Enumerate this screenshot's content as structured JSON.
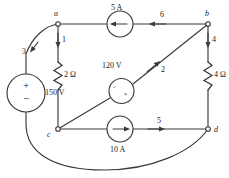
{
  "figure": {
    "line_color": "#3a3a3a",
    "text_color": "#1a1a1a"
  },
  "nodes": [
    {
      "id": "a",
      "label": "a"
    },
    {
      "id": "b",
      "label": "b"
    },
    {
      "id": "c",
      "label": "c"
    },
    {
      "id": "d",
      "label": "d"
    }
  ],
  "branches": [
    {
      "id": "1",
      "label": "1",
      "between": "a-c",
      "arrow": "down"
    },
    {
      "id": "2",
      "label": "2",
      "between": "c-b",
      "arrow": "up-right"
    },
    {
      "id": "3",
      "label": "3",
      "between": "a-source-d",
      "arrow": "down-left"
    },
    {
      "id": "4",
      "label": "4",
      "between": "b-d",
      "arrow": "down"
    },
    {
      "id": "5",
      "label": "5",
      "between": "c-d",
      "arrow": "right"
    },
    {
      "id": "6",
      "label": "6",
      "between": "b-a",
      "arrow": "left"
    }
  ],
  "components": [
    {
      "id": "current-source-top",
      "type": "current-source",
      "value": "5 A",
      "direction": "left",
      "branch": "6"
    },
    {
      "id": "current-source-bottom",
      "type": "current-source",
      "value": "10 A",
      "direction": "right",
      "branch": "5"
    },
    {
      "id": "voltage-source-left",
      "type": "voltage-source",
      "value": "150 V",
      "plus": "+",
      "minus": "−",
      "branch": "3"
    },
    {
      "id": "voltage-source-center",
      "type": "voltage-source",
      "value": "120 V",
      "plus": "+",
      "minus": "−",
      "branch": "2"
    },
    {
      "id": "resistor-left",
      "type": "resistor",
      "value": "2 Ω",
      "branch": "1"
    },
    {
      "id": "resistor-right",
      "type": "resistor",
      "value": "4 Ω",
      "branch": "4"
    }
  ]
}
